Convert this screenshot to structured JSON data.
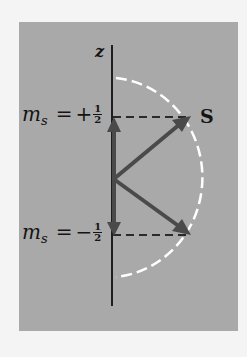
{
  "diagram": {
    "type": "electron spin vector model",
    "axis_label": "z",
    "vector_label": "S",
    "states": [
      {
        "symbol": "m",
        "subscript": "s",
        "equals": "=",
        "sign": "+",
        "numerator": "1",
        "denominator": "2"
      },
      {
        "symbol": "m",
        "subscript": "s",
        "equals": "=",
        "sign": "−",
        "numerator": "1",
        "denominator": "2"
      }
    ],
    "colors": {
      "background": "#f4f4f4",
      "panel": "#a9a9a9",
      "axis": "#1e1e1e",
      "vectors": "#4a4a4a",
      "dashed_lines": "#2a2a2a",
      "arc": "#ffffff",
      "text": "#141414"
    }
  }
}
